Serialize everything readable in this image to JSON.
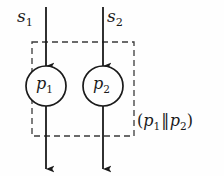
{
  "figure": {
    "type": "process-flow-diagram",
    "background_color": "#fefefe",
    "stroke_color": "#1a1a1a",
    "dashed_box": {
      "x": 32,
      "y": 42,
      "width": 102,
      "height": 94,
      "style": "dashed"
    }
  },
  "inputs": [
    {
      "id": "s1",
      "base": "s",
      "subscript": "1",
      "line_x": 46,
      "label_side": "left"
    },
    {
      "id": "s2",
      "base": "s",
      "subscript": "2",
      "line_x": 103,
      "label_side": "right"
    }
  ],
  "nodes": [
    {
      "id": "p1",
      "base": "p",
      "subscript": "1",
      "cx": 46,
      "cy": 86,
      "r": 20,
      "shape": "circle"
    },
    {
      "id": "p2",
      "base": "p",
      "subscript": "2",
      "cx": 103,
      "cy": 86,
      "r": 20,
      "shape": "circle"
    }
  ],
  "composition_label": {
    "open_paren": "(",
    "left_base": "p",
    "left_subscript": "1",
    "operator": "‖",
    "right_base": "p",
    "right_subscript": "2",
    "close_paren": ")",
    "text": "(p1‖p2)"
  }
}
